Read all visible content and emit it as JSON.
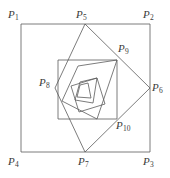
{
  "figure": {
    "canvas": {
      "width": 170,
      "height": 178
    },
    "stroke_color": "#5a5a5a",
    "label_color": "#3a3a3a",
    "background_color": "#ffffff",
    "stroke_width": 0.8,
    "labels": [
      {
        "id": "P1",
        "base": "P",
        "sub": "1",
        "text": "P1",
        "x": 8,
        "y": 9,
        "anchor": "top-left"
      },
      {
        "id": "P5",
        "base": "P",
        "sub": "5",
        "text": "P5",
        "x": 76,
        "y": 9,
        "anchor": "top-center"
      },
      {
        "id": "P2",
        "base": "P",
        "sub": "2",
        "text": "P2",
        "x": 143,
        "y": 9,
        "anchor": "top-right"
      },
      {
        "id": "P9",
        "base": "P",
        "sub": "9",
        "text": "P9",
        "x": 118,
        "y": 43,
        "anchor": "top-right"
      },
      {
        "id": "P8",
        "base": "P",
        "sub": "8",
        "text": "P8",
        "x": 39,
        "y": 77,
        "anchor": "left"
      },
      {
        "id": "P6",
        "base": "P",
        "sub": "6",
        "text": "P6",
        "x": 152,
        "y": 82,
        "anchor": "right"
      },
      {
        "id": "P10",
        "base": "P",
        "sub": "10",
        "text": "P10",
        "x": 116,
        "y": 120,
        "anchor": "bottom-right"
      },
      {
        "id": "P4",
        "base": "P",
        "sub": "4",
        "text": "P4",
        "x": 8,
        "y": 156,
        "anchor": "bottom-left"
      },
      {
        "id": "P7",
        "base": "P",
        "sub": "7",
        "text": "P7",
        "x": 78,
        "y": 156,
        "anchor": "bottom-center"
      },
      {
        "id": "P3",
        "base": "P",
        "sub": "3",
        "text": "P3",
        "x": 143,
        "y": 156,
        "anchor": "bottom-right"
      }
    ],
    "vertices": {
      "P1": {
        "x": 21,
        "y": 24
      },
      "P2": {
        "x": 150,
        "y": 24
      },
      "P3": {
        "x": 150,
        "y": 152
      },
      "P4": {
        "x": 21,
        "y": 152
      },
      "P5": {
        "x": 85,
        "y": 24
      },
      "P6": {
        "x": 150,
        "y": 88
      },
      "P7": {
        "x": 85,
        "y": 152
      },
      "P8": {
        "x": 55,
        "y": 88
      },
      "P9": {
        "x": 117,
        "y": 60
      },
      "P10": {
        "x": 117,
        "y": 119
      }
    },
    "polygons": [
      {
        "name": "outer-square",
        "points": "21,24 150,24 150,152 21,152",
        "vertex_ids": [
          "P1",
          "P2",
          "P3",
          "P4"
        ]
      },
      {
        "name": "second-square",
        "points": "85,24 150,88 85,152 55,88",
        "vertex_ids": [
          "P5",
          "P6",
          "P7",
          "P8"
        ]
      },
      {
        "name": "third-square",
        "points": "117,60 117,119 58,119 58,60",
        "vertex_ids": [
          "P9",
          "P10"
        ]
      },
      {
        "name": "fourth-square",
        "points": "117,60 97,119 62,101 78,66",
        "vertex_ids": []
      },
      {
        "name": "fifth-square",
        "points": "97,78 105,104 79,112 71,86",
        "vertex_ids": []
      },
      {
        "name": "sixth-square",
        "points": "97,78 93,103 75,100 80,82",
        "vertex_ids": []
      },
      {
        "name": "seventh-square",
        "points": "88,83 91,98 77,97 80,85",
        "vertex_ids": []
      }
    ]
  }
}
